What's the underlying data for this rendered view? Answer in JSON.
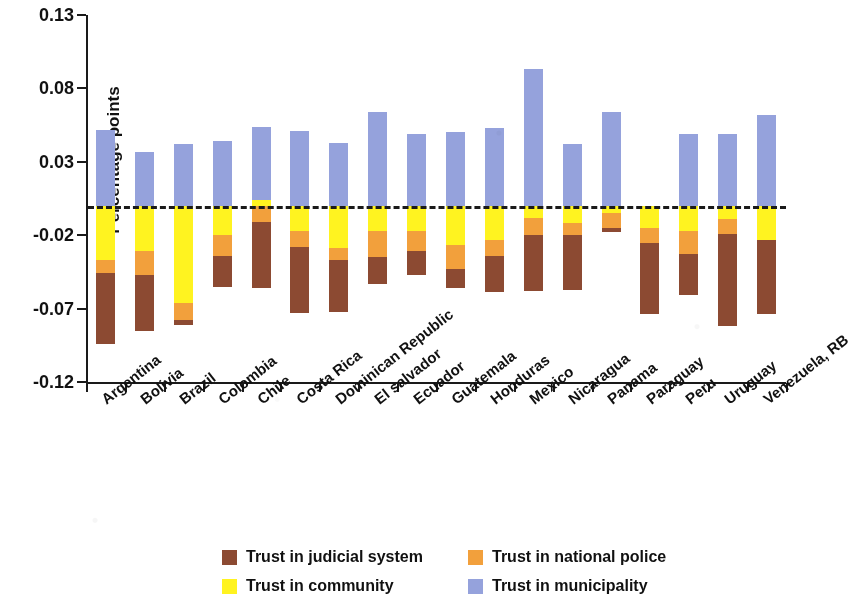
{
  "chart_data": {
    "type": "bar",
    "stacked": true,
    "orientation": "vertical",
    "title": "",
    "xlabel": "",
    "ylabel": "Percentage points",
    "ylim": [
      -0.12,
      0.13
    ],
    "yticks": [
      0.13,
      0.08,
      0.03,
      -0.02,
      -0.07,
      -0.12
    ],
    "ytick_labels": [
      "0.13",
      "0.08",
      "0.03",
      "-0.02",
      "-0.07",
      "-0.12"
    ],
    "grid": false,
    "zero_reference_line": true,
    "legend_position": "bottom",
    "categories": [
      "Argentina",
      "Bolivia",
      "Brazil",
      "Colombia",
      "Chile",
      "Costa Rica",
      "Dominican Republic",
      "El salvador",
      "Ecuador",
      "Guatemala",
      "Honduras",
      "Mexico",
      "Nicaragua",
      "Panama",
      "Paraguay",
      "Peru",
      "Uruguay",
      "Venezuela, RB"
    ],
    "series": [
      {
        "name": "Trust in municipality",
        "color": "#95A2DC",
        "values": [
          0.052,
          0.037,
          0.042,
          0.044,
          0.05,
          0.051,
          0.043,
          0.064,
          0.049,
          0.05,
          0.053,
          0.093,
          0.042,
          0.064,
          0.0,
          0.049,
          0.049,
          0.062
        ]
      },
      {
        "name": "Trust in judicial system",
        "color": "#8C4A32",
        "values": [
          -0.048,
          -0.038,
          -0.003,
          -0.021,
          -0.045,
          -0.045,
          -0.035,
          -0.018,
          -0.016,
          -0.013,
          -0.025,
          -0.038,
          -0.037,
          -0.003,
          -0.049,
          -0.028,
          -0.063,
          -0.051
        ]
      },
      {
        "name": "Trust in national police",
        "color": "#F2A03C",
        "values": [
          -0.009,
          -0.016,
          -0.012,
          -0.014,
          -0.011,
          -0.011,
          -0.008,
          -0.018,
          -0.014,
          -0.016,
          -0.011,
          -0.012,
          -0.008,
          -0.01,
          -0.01,
          -0.016,
          -0.01,
          0.0
        ]
      },
      {
        "name": "Trust in community",
        "color": "#FFF320",
        "values": [
          -0.037,
          -0.031,
          -0.066,
          -0.02,
          0.004,
          -0.017,
          -0.029,
          -0.017,
          -0.017,
          -0.027,
          -0.023,
          -0.008,
          -0.012,
          -0.005,
          -0.015,
          -0.017,
          -0.009,
          -0.023
        ]
      }
    ]
  },
  "axis": {
    "ylabel": "Percentage points"
  },
  "legend": {
    "items": [
      {
        "label": "Trust in judicial system",
        "color": "#8C4A32"
      },
      {
        "label": "Trust in national police",
        "color": "#F2A03C"
      },
      {
        "label": "Trust in community",
        "color": "#FFF320"
      },
      {
        "label": "Trust in municipality",
        "color": "#95A2DC"
      }
    ]
  }
}
